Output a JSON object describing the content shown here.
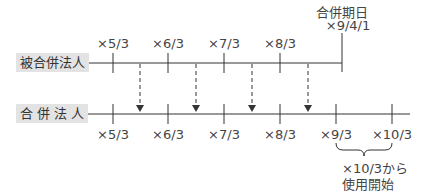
{
  "diagram": {
    "entities": {
      "absorbed": "被合併法人",
      "surviving": "合 併 法 人"
    },
    "merger": {
      "title": "合併期日",
      "date": "×9/4/1"
    },
    "absorbed_ticks": [
      "×5/3",
      "×6/3",
      "×7/3",
      "×8/3"
    ],
    "surviving_ticks": [
      "×5/3",
      "×6/3",
      "×7/3",
      "×8/3",
      "×9/3",
      "×10/3"
    ],
    "note": {
      "line1": "×10/3から",
      "line2": "使用開始"
    },
    "colors": {
      "line": "#333333",
      "label_bg": "#e3e3e3"
    }
  }
}
